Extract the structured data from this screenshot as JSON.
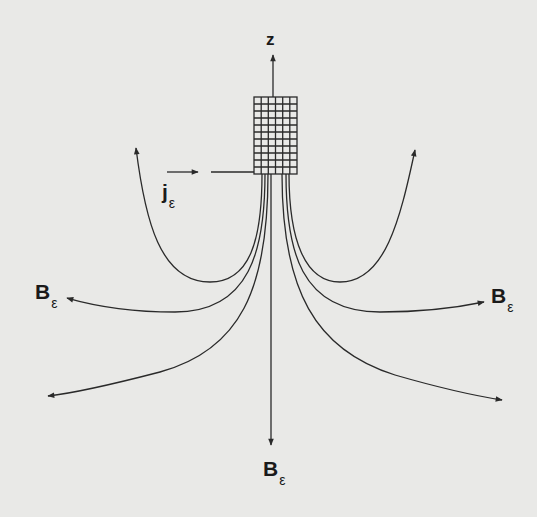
{
  "diagram": {
    "type": "magnetic-field-lines",
    "axis": {
      "label": "z"
    },
    "current": {
      "symbol": "j",
      "subscript": "ε"
    },
    "field_labels": [
      {
        "symbol": "B",
        "subscript": "ε",
        "position": "left"
      },
      {
        "symbol": "B",
        "subscript": "ε",
        "position": "right"
      },
      {
        "symbol": "B",
        "subscript": "ε",
        "position": "bottom"
      }
    ],
    "colors": {
      "line": "#2a2a2a",
      "background": "#e9e9e7"
    },
    "source_grid": {
      "columns": 6,
      "rows": 11
    }
  }
}
